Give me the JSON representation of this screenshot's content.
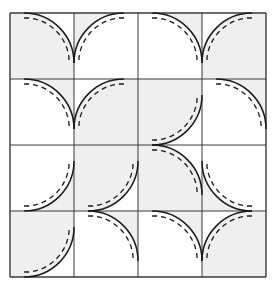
{
  "figure": {
    "name": "drunkards-path-quilt-block-diagram",
    "canvas": {
      "width": 276,
      "height": 286
    },
    "background_color": "#ffffff"
  },
  "grid": {
    "rows": 4,
    "cols": 4,
    "origin_x": 10,
    "origin_y": 13,
    "cell_width": 64,
    "cell_height": 66,
    "line_color": "#3a3a3a",
    "line_width": 1,
    "outer_line_width": 1.4
  },
  "style": {
    "patch_fill": "#efefef",
    "patch_empty_fill": "#ffffff",
    "arc_color": "#1a1a1a",
    "arc_width": 1.5,
    "seam_color": "#1a1a1a",
    "seam_width": 1.3,
    "seam_dash": "5,4",
    "seam_inset": 5,
    "arc_radius_ratio": 0.78
  },
  "legend": {
    "solid_line_meaning": "cut edge / finished seam line",
    "dashed_line_meaning": "seam allowance stitching line",
    "shaded_meaning": "contrast fabric patch"
  },
  "patches": [
    {
      "row": 0,
      "col": 0,
      "corner": "TR",
      "shaded": "outside",
      "label": "patch-r0c0"
    },
    {
      "row": 0,
      "col": 1,
      "corner": "TL",
      "shaded": "inside",
      "label": "patch-r0c1"
    },
    {
      "row": 0,
      "col": 2,
      "corner": "TR",
      "shaded": "inside",
      "label": "patch-r0c2"
    },
    {
      "row": 0,
      "col": 3,
      "corner": "TL",
      "shaded": "outside",
      "label": "patch-r0c3"
    },
    {
      "row": 1,
      "col": 0,
      "corner": "TR",
      "shaded": "inside",
      "label": "patch-r1c0"
    },
    {
      "row": 1,
      "col": 1,
      "corner": "TL",
      "shaded": "outside",
      "label": "patch-r1c1"
    },
    {
      "row": 1,
      "col": 2,
      "corner": "BR",
      "shaded": "outside",
      "label": "patch-r1c2"
    },
    {
      "row": 1,
      "col": 3,
      "corner": "TR",
      "shaded": "inside",
      "label": "patch-r1c3"
    },
    {
      "row": 2,
      "col": 0,
      "corner": "BR",
      "shaded": "inside",
      "label": "patch-r2c0"
    },
    {
      "row": 2,
      "col": 1,
      "corner": "BR",
      "shaded": "outside",
      "label": "patch-r2c1"
    },
    {
      "row": 2,
      "col": 2,
      "corner": "TR",
      "shaded": "outside",
      "label": "patch-r2c2"
    },
    {
      "row": 2,
      "col": 3,
      "corner": "BL",
      "shaded": "inside",
      "label": "patch-r2c3"
    },
    {
      "row": 3,
      "col": 0,
      "corner": "BR",
      "shaded": "outside",
      "label": "patch-r3c0"
    },
    {
      "row": 3,
      "col": 1,
      "corner": "TR",
      "shaded": "inside",
      "label": "patch-r3c1"
    },
    {
      "row": 3,
      "col": 2,
      "corner": "TR",
      "shaded": "inside",
      "label": "patch-r3c2"
    },
    {
      "row": 3,
      "col": 3,
      "corner": "TL",
      "shaded": "outside",
      "label": "patch-r3c3"
    }
  ]
}
